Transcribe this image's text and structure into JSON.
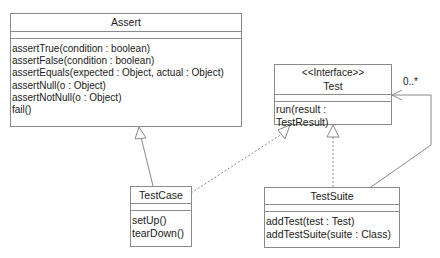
{
  "diagram": {
    "type": "UML class diagram",
    "classes": {
      "assert": {
        "name": "Assert",
        "operations": [
          "assertTrue(condition : boolean)",
          "assertFalse(condition : boolean)",
          "assertEquals(expected : Object, actual : Object)",
          "assertNull(o : Object)",
          "assertNotNull(o : Object)",
          "fail()"
        ]
      },
      "test": {
        "stereotype": "<<Interface>>",
        "name": "Test",
        "operations": [
          "run(result :",
          "TestResult)"
        ]
      },
      "testcase": {
        "name": "TestCase",
        "operations": [
          "setUp()",
          "tearDown()"
        ]
      },
      "testsuite": {
        "name": "TestSuite",
        "operations": [
          "addTest(test : Test)",
          "addTestSuite(suite : Class)"
        ]
      }
    },
    "relationships": [
      {
        "from": "TestCase",
        "to": "Assert",
        "kind": "generalization"
      },
      {
        "from": "TestCase",
        "to": "Test",
        "kind": "realization"
      },
      {
        "from": "TestSuite",
        "to": "Test",
        "kind": "realization"
      },
      {
        "from": "TestSuite",
        "to": "Test",
        "kind": "association",
        "multiplicity": "0..*"
      }
    ],
    "multiplicity_label": "0..*",
    "colors": {
      "line": "#8a8a8a",
      "text": "#1a1a1a",
      "background": "#ffffff"
    }
  }
}
